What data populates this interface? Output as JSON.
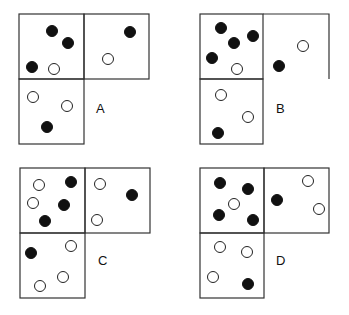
{
  "colors": {
    "filled": "#111111",
    "open": "#ffffff",
    "stroke": "#222222"
  },
  "panels": [
    {
      "label": "A",
      "cells": {
        "top_left": {
          "dots": [
            {
              "type": "filled",
              "x": 52,
              "y": 31
            },
            {
              "type": "filled",
              "x": 68,
              "y": 43
            },
            {
              "type": "filled",
              "x": 32,
              "y": 67
            },
            {
              "type": "open",
              "x": 54,
              "y": 69
            }
          ]
        },
        "top_right": {
          "dots": [
            {
              "type": "filled",
              "x": 130,
              "y": 32
            },
            {
              "type": "open",
              "x": 108,
              "y": 59
            }
          ]
        },
        "bottom": {
          "dots": [
            {
              "type": "open",
              "x": 33,
              "y": 97
            },
            {
              "type": "open",
              "x": 67,
              "y": 106
            },
            {
              "type": "filled",
              "x": 47,
              "y": 127
            }
          ]
        }
      }
    },
    {
      "label": "B",
      "cells": {
        "top_left": {
          "dots": [
            {
              "type": "filled",
              "x": 221,
              "y": 28
            },
            {
              "type": "filled",
              "x": 234,
              "y": 43
            },
            {
              "type": "filled",
              "x": 253,
              "y": 36
            },
            {
              "type": "filled",
              "x": 212,
              "y": 58
            },
            {
              "type": "open",
              "x": 237,
              "y": 69
            }
          ]
        },
        "top_right": {
          "dots": [
            {
              "type": "open",
              "x": 303,
              "y": 46
            },
            {
              "type": "filled",
              "x": 279,
              "y": 66
            }
          ]
        },
        "bottom": {
          "dots": [
            {
              "type": "open",
              "x": 221,
              "y": 95
            },
            {
              "type": "open",
              "x": 248,
              "y": 117
            },
            {
              "type": "filled",
              "x": 218,
              "y": 133
            }
          ]
        }
      }
    },
    {
      "label": "C",
      "cells": {
        "top_left": {
          "dots": [
            {
              "type": "open",
              "x": 39,
              "y": 185
            },
            {
              "type": "open",
              "x": 33,
              "y": 203
            },
            {
              "type": "filled",
              "x": 71,
              "y": 182
            },
            {
              "type": "filled",
              "x": 64,
              "y": 205
            },
            {
              "type": "filled",
              "x": 45,
              "y": 221
            }
          ]
        },
        "top_right": {
          "dots": [
            {
              "type": "open",
              "x": 100,
              "y": 184
            },
            {
              "type": "open",
              "x": 97,
              "y": 220
            },
            {
              "type": "filled",
              "x": 132,
              "y": 195
            }
          ]
        },
        "bottom": {
          "dots": [
            {
              "type": "filled",
              "x": 31,
              "y": 253
            },
            {
              "type": "open",
              "x": 71,
              "y": 246
            },
            {
              "type": "open",
              "x": 63,
              "y": 277
            },
            {
              "type": "open",
              "x": 40,
              "y": 286
            }
          ]
        }
      }
    },
    {
      "label": "D",
      "cells": {
        "top_left": {
          "dots": [
            {
              "type": "filled",
              "x": 220,
              "y": 183
            },
            {
              "type": "filled",
              "x": 248,
              "y": 189
            },
            {
              "type": "filled",
              "x": 219,
              "y": 215
            },
            {
              "type": "filled",
              "x": 253,
              "y": 220
            },
            {
              "type": "open",
              "x": 234,
              "y": 204
            }
          ]
        },
        "top_right": {
          "dots": [
            {
              "type": "filled",
              "x": 277,
              "y": 200
            },
            {
              "type": "open",
              "x": 308,
              "y": 181
            },
            {
              "type": "open",
              "x": 319,
              "y": 209
            }
          ]
        },
        "bottom": {
          "dots": [
            {
              "type": "open",
              "x": 220,
              "y": 247
            },
            {
              "type": "open",
              "x": 247,
              "y": 252
            },
            {
              "type": "open",
              "x": 213,
              "y": 277
            },
            {
              "type": "filled",
              "x": 248,
              "y": 284
            }
          ]
        }
      }
    }
  ]
}
